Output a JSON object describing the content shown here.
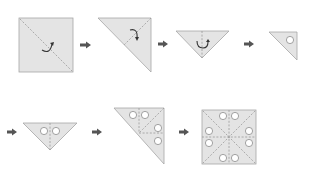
{
  "diagram": {
    "colors": {
      "paper": "#e4e4e4",
      "outline": "#a6a6a6",
      "crease": "#9a9a9a",
      "hole": "#ffffff",
      "arrow": "#555555"
    },
    "steps": [
      {
        "id": 1,
        "shape": "square",
        "description": "Square sheet with diagonal crease, fold arrow"
      },
      {
        "id": 2,
        "shape": "right-triangle",
        "description": "Folded along diagonal, fold arrow"
      },
      {
        "id": 3,
        "shape": "inverted-triangle",
        "description": "Folded in half again, fold arrow"
      },
      {
        "id": 4,
        "shape": "small-triangle",
        "description": "Folded into small triangle, one hole punched",
        "holes": 1
      },
      {
        "id": 5,
        "shape": "inverted-triangle",
        "description": "Unfolded once, two holes",
        "holes": 2
      },
      {
        "id": 6,
        "shape": "right-triangle",
        "description": "Unfolded again, four holes",
        "holes": 4
      },
      {
        "id": 7,
        "shape": "square",
        "description": "Fully unfolded square, eight holes",
        "holes": 8
      }
    ],
    "arrows": 6
  }
}
